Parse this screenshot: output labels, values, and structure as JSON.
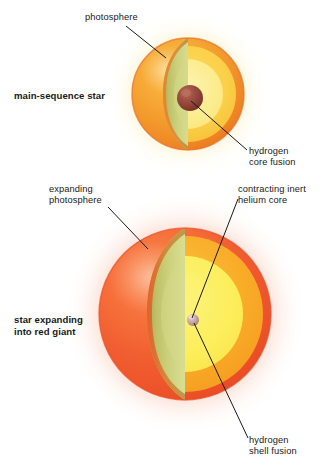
{
  "figure": {
    "background_color": "#ffffff",
    "text_color": "#1a1a1a",
    "leader_line_color": "#1a1a1a"
  },
  "labels": {
    "photosphere": "photosphere",
    "main_sequence_star": "main-sequence star",
    "hydrogen_core_fusion": "hydrogen\ncore fusion",
    "expanding_photosphere": "expanding\nphotosphere",
    "contracting_inert_helium_core": "contracting inert\nhelium core",
    "star_expanding_into_red_giant": "star expanding\ninto red giant",
    "hydrogen_shell_fusion": "hydrogen\nshell fusion"
  },
  "diagrams": [
    {
      "name": "main-sequence-star",
      "stage": "main sequence",
      "center": {
        "x": 188,
        "y": 94
      },
      "radius": 56,
      "glow_color": "#fdf3c4",
      "layers": [
        {
          "name": "photosphere-outer",
          "color": "#f5a623",
          "rim_color": "#ef7c2b"
        },
        {
          "name": "cutaway-face-shell",
          "color": "#c9cf72"
        },
        {
          "name": "interior-mid",
          "color": "#fbd34a"
        },
        {
          "name": "interior-inner",
          "color": "#fbeb8a"
        },
        {
          "name": "core",
          "color": "#8e4236",
          "radius": 13
        }
      ],
      "callouts": [
        {
          "name": "photosphere",
          "label_key": "photosphere"
        },
        {
          "name": "hydrogen-core-fusion",
          "label_key": "hydrogen_core_fusion"
        }
      ]
    },
    {
      "name": "red-giant-star",
      "stage": "red giant",
      "center": {
        "x": 185,
        "y": 314
      },
      "radius": 86,
      "glow_color": "#fbd9cc",
      "layers": [
        {
          "name": "photosphere-outer",
          "color": "#f26c3d",
          "rim_color": "#e8552c"
        },
        {
          "name": "cutaway-face-shell",
          "color": "#c9cf72"
        },
        {
          "name": "interior-mid",
          "color": "#f8a827"
        },
        {
          "name": "interior-inner",
          "color": "#fbec5c"
        },
        {
          "name": "core",
          "color": "#c08a94",
          "radius": 6
        }
      ],
      "callouts": [
        {
          "name": "expanding-photosphere",
          "label_key": "expanding_photosphere"
        },
        {
          "name": "contracting-inert-helium-core",
          "label_key": "contracting_inert_helium_core"
        },
        {
          "name": "hydrogen-shell-fusion",
          "label_key": "hydrogen_shell_fusion"
        }
      ]
    }
  ]
}
